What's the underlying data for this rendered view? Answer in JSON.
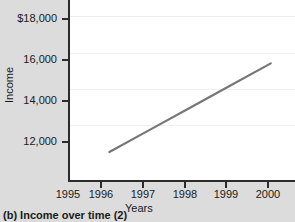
{
  "caption": "(b) Income over time (2)",
  "colors": {
    "figure_background": "#dcdcdc",
    "plot_background": "#ffffff",
    "line": "#777777",
    "axis": "#2b2b2b",
    "gridline": "#eef0f2",
    "text": "#1a1a1a"
  },
  "chart_data": {
    "type": "line",
    "title": "",
    "subtitle": "",
    "xlabel": "Years",
    "ylabel": "Income",
    "x": [
      1996,
      1997,
      1998,
      1999,
      2000
    ],
    "series": [
      {
        "name": "Income",
        "values": [
          10500,
          11725,
          12950,
          14175,
          15400
        ],
        "color": "#777777"
      }
    ],
    "xlim": [
      1995,
      2000.6
    ],
    "ylim": [
      8900,
      18900
    ],
    "xticks": [
      1995,
      1996,
      1997,
      1998,
      1999,
      2000
    ],
    "xtick_labels": [
      "1995",
      "1996",
      "1997",
      "1998",
      "1999",
      "2000"
    ],
    "yticks": [
      10000,
      12000,
      14000,
      16000,
      18000
    ],
    "ytick_labels": [
      "10,000",
      "12,000",
      "14,000",
      "16,000",
      "$18,000"
    ],
    "grid": true,
    "grid_axis": "y",
    "legend": false,
    "legend_position": "none",
    "markers": false,
    "annotations": []
  }
}
